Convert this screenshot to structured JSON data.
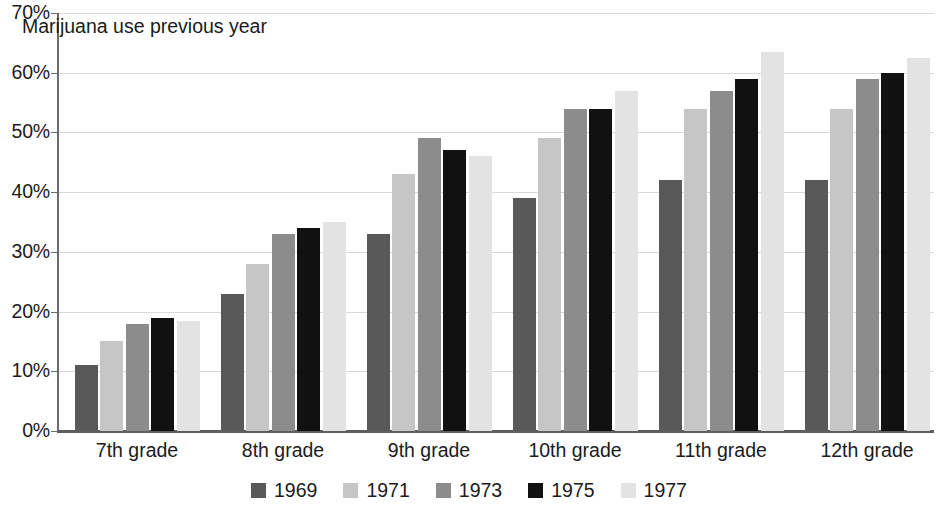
{
  "chart_data": {
    "type": "bar",
    "title": "Marijuana use previous year",
    "xlabel": "",
    "ylabel": "",
    "ylim": [
      0,
      70
    ],
    "y_tick_step": 10,
    "grid": true,
    "legend_position": "bottom",
    "value_suffix": "%",
    "categories": [
      "7th grade",
      "8th grade",
      "9th grade",
      "10th grade",
      "11th grade",
      "12th grade"
    ],
    "y_tick_labels": [
      "0%",
      "10%",
      "20%",
      "30%",
      "40%",
      "50%",
      "60%",
      "70%"
    ],
    "series": [
      {
        "name": "1969",
        "color": "#595959",
        "values": [
          11,
          23,
          33,
          39,
          42,
          42
        ]
      },
      {
        "name": "1971",
        "color": "#c6c6c6",
        "values": [
          15,
          28,
          43,
          49,
          54,
          54
        ]
      },
      {
        "name": "1973",
        "color": "#8c8c8c",
        "values": [
          18,
          33,
          49,
          54,
          57,
          59
        ]
      },
      {
        "name": "1975",
        "color": "#111111",
        "values": [
          19,
          34,
          47,
          54,
          59,
          60
        ]
      },
      {
        "name": "1977",
        "color": "#e3e3e3",
        "values": [
          18.5,
          35,
          46,
          57,
          63.5,
          62.5
        ]
      }
    ]
  },
  "axis": {
    "spine_color": "#6b6b6b",
    "baseline_color": "#5e5e5e",
    "gridline_color": "#d9d9d9"
  }
}
